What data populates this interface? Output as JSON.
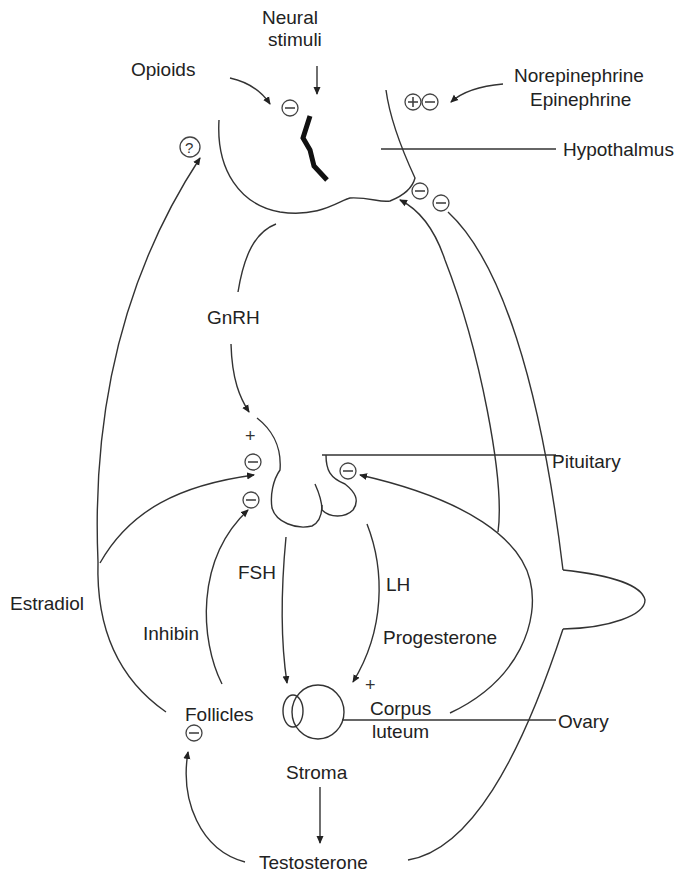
{
  "diagram": {
    "type": "hormonal-feedback-diagram",
    "structures": {
      "hypothalamus": "Hypothalmus",
      "pituitary": "Pituitary",
      "ovary": "Ovary"
    },
    "inputs": {
      "neural": [
        "Neural",
        "stimuli"
      ],
      "opioids": "Opioids",
      "catecholamines": [
        "Norepinephrine",
        "Epinephrine"
      ]
    },
    "hormones": {
      "gnrh": "GnRH",
      "fsh": "FSH",
      "lh": "LH",
      "estradiol": "Estradiol",
      "inhibin": "Inhibin",
      "progesterone": "Progesterone",
      "testosterone": "Testosterone"
    },
    "ovary_parts": {
      "follicles": "Follicles",
      "corpus_luteum": [
        "Corpus",
        "luteum"
      ],
      "stroma": "Stroma"
    },
    "symbols": {
      "plus": "+",
      "unknown": "?"
    },
    "effects": [
      {
        "from": "Opioids",
        "to": "Hypothalmus",
        "sign": "negative"
      },
      {
        "from": "Neural stimuli",
        "to": "Hypothalmus",
        "sign": "input"
      },
      {
        "from": "Norepinephrine/Epinephrine",
        "to": "Hypothalmus",
        "sign": "positive/negative"
      },
      {
        "from": "Estradiol",
        "to": "Hypothalmus",
        "sign": "unknown"
      },
      {
        "from": "Progesterone",
        "to": "Hypothalmus",
        "sign": "negative"
      },
      {
        "from": "Testosterone",
        "to": "Hypothalmus",
        "sign": "negative"
      },
      {
        "from": "GnRH",
        "to": "Pituitary",
        "sign": "positive"
      },
      {
        "from": "Estradiol",
        "to": "Pituitary",
        "sign": "negative"
      },
      {
        "from": "Inhibin",
        "to": "Pituitary",
        "sign": "negative"
      },
      {
        "from": "Progesterone",
        "to": "Pituitary",
        "sign": "negative"
      },
      {
        "from": "FSH",
        "to": "Follicles",
        "sign": "input"
      },
      {
        "from": "LH",
        "to": "Corpus luteum",
        "sign": "positive"
      },
      {
        "from": "Stroma",
        "to": "Testosterone",
        "sign": "produces"
      },
      {
        "from": "Testosterone",
        "to": "Follicles",
        "sign": "negative"
      }
    ]
  }
}
